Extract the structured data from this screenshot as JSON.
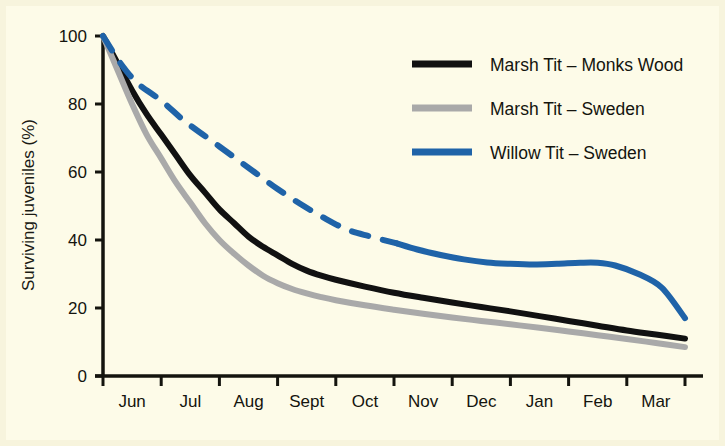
{
  "figure": {
    "background_color": "#fdfbe8",
    "frame_color": "#f6f2da",
    "axis_color": "#14140e"
  },
  "chart_data": {
    "type": "line",
    "title": "",
    "subtitle": "",
    "xlabel": "",
    "ylabel": "Surviving juveniles (%)",
    "xlim": [
      0,
      10
    ],
    "ylim": [
      0,
      100
    ],
    "yticks": [
      0,
      20,
      40,
      60,
      80,
      100
    ],
    "ytick_labels": [
      "0",
      "20",
      "40",
      "60",
      "80",
      "100"
    ],
    "xtick_labels": [
      "Jun",
      "Jul",
      "Aug",
      "Sept",
      "Oct",
      "Nov",
      "Dec",
      "Jan",
      "Feb",
      "Mar"
    ],
    "x": [
      0,
      1,
      2,
      3,
      4,
      5,
      6,
      7,
      8,
      9,
      10
    ],
    "grid": false,
    "legend_position": "upper right",
    "series": [
      {
        "name": "Marsh Tit – Monks Wood",
        "color": "#111111",
        "style": "solid",
        "width": 6,
        "values": [
          100,
          72,
          52,
          38,
          30,
          26,
          23,
          20,
          17,
          14,
          11
        ],
        "points": [
          [
            0.0,
            100
          ],
          [
            0.25,
            92
          ],
          [
            0.5,
            84
          ],
          [
            0.75,
            77
          ],
          [
            1.0,
            71
          ],
          [
            1.25,
            65
          ],
          [
            1.5,
            59
          ],
          [
            1.75,
            54
          ],
          [
            2.0,
            49
          ],
          [
            2.25,
            45
          ],
          [
            2.5,
            41
          ],
          [
            2.75,
            38
          ],
          [
            3.0,
            35.5
          ],
          [
            3.25,
            33
          ],
          [
            3.5,
            31
          ],
          [
            3.75,
            29.5
          ],
          [
            4.0,
            28.3
          ],
          [
            4.5,
            26.3
          ],
          [
            5.0,
            24.5
          ],
          [
            5.5,
            23.0
          ],
          [
            6.0,
            21.6
          ],
          [
            6.5,
            20.3
          ],
          [
            7.0,
            19.0
          ],
          [
            7.5,
            17.6
          ],
          [
            8.0,
            16.2
          ],
          [
            8.5,
            14.8
          ],
          [
            9.0,
            13.4
          ],
          [
            9.5,
            12.2
          ],
          [
            10.0,
            11.0
          ]
        ]
      },
      {
        "name": "Marsh Tit – Sweden",
        "color": "#a9a9a9",
        "style": "solid",
        "width": 6,
        "values": [
          100,
          66,
          44,
          31,
          25,
          21,
          18,
          16,
          14,
          11,
          8.5
        ],
        "points": [
          [
            0.0,
            100
          ],
          [
            0.25,
            90
          ],
          [
            0.5,
            80
          ],
          [
            0.75,
            71
          ],
          [
            1.0,
            64
          ],
          [
            1.25,
            57
          ],
          [
            1.5,
            51
          ],
          [
            1.75,
            45
          ],
          [
            2.0,
            40
          ],
          [
            2.25,
            36
          ],
          [
            2.5,
            32.5
          ],
          [
            2.75,
            29.5
          ],
          [
            3.0,
            27.3
          ],
          [
            3.25,
            25.6
          ],
          [
            3.5,
            24.3
          ],
          [
            3.75,
            23.2
          ],
          [
            4.0,
            22.3
          ],
          [
            4.5,
            20.8
          ],
          [
            5.0,
            19.5
          ],
          [
            5.5,
            18.3
          ],
          [
            6.0,
            17.2
          ],
          [
            6.5,
            16.2
          ],
          [
            7.0,
            15.2
          ],
          [
            7.5,
            14.2
          ],
          [
            8.0,
            13.1
          ],
          [
            8.5,
            12.0
          ],
          [
            9.0,
            10.9
          ],
          [
            9.5,
            9.7
          ],
          [
            10.0,
            8.5
          ]
        ]
      },
      {
        "name": "Willow Tit – Sweden",
        "color": "#1f63a8",
        "style": "dashed-then-solid",
        "width": 6,
        "dash_until_x": 5.05,
        "values": [
          100,
          86,
          73,
          60,
          47,
          38,
          34,
          33,
          32,
          25,
          17
        ],
        "points": [
          [
            0.0,
            100
          ],
          [
            0.3,
            92
          ],
          [
            0.6,
            86
          ],
          [
            1.0,
            81
          ],
          [
            1.4,
            75
          ],
          [
            1.8,
            70
          ],
          [
            2.2,
            65
          ],
          [
            2.6,
            60
          ],
          [
            3.0,
            55
          ],
          [
            3.4,
            50.5
          ],
          [
            3.8,
            46.5
          ],
          [
            4.2,
            43
          ],
          [
            4.6,
            41
          ],
          [
            5.05,
            39
          ],
          [
            5.4,
            37.2
          ],
          [
            5.8,
            35.6
          ],
          [
            6.2,
            34.3
          ],
          [
            6.6,
            33.4
          ],
          [
            7.0,
            33.0
          ],
          [
            7.4,
            32.8
          ],
          [
            7.8,
            33.0
          ],
          [
            8.2,
            33.3
          ],
          [
            8.5,
            33.3
          ],
          [
            8.8,
            32.5
          ],
          [
            9.2,
            30.0
          ],
          [
            9.6,
            26.0
          ],
          [
            10.0,
            17.0
          ]
        ]
      }
    ]
  },
  "legend": {
    "entries": [
      {
        "label": "Marsh Tit – Monks Wood",
        "color": "#111111",
        "dashed": false
      },
      {
        "label": "Marsh Tit – Sweden",
        "color": "#a9a9a9",
        "dashed": false
      },
      {
        "label": "Willow Tit – Sweden",
        "color": "#1f63a8",
        "dashed": false
      }
    ]
  }
}
